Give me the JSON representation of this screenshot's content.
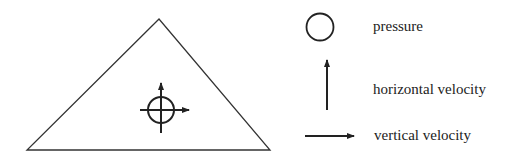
{
  "diagram": {
    "element": {
      "shape": "triangle",
      "node_symbol": "circle-with-arrows"
    },
    "legend": [
      {
        "icon": "circle-icon",
        "label": "pressure"
      },
      {
        "icon": "arrow-up-icon",
        "label": "horizontal velocity"
      },
      {
        "icon": "arrow-right-icon",
        "label": "vertical velocity"
      }
    ],
    "colors": {
      "stroke": "#222222",
      "background": "#ffffff"
    }
  }
}
